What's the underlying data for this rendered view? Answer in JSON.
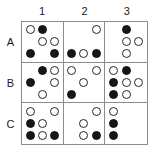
{
  "figure": {
    "title": "",
    "type": "dot-pattern-matrix",
    "rows": 3,
    "columns": 3,
    "colors": {
      "filled_dot": "#161616",
      "open_dot_outline": "#262626",
      "open_dot_fill": "#ffffff",
      "grid_line": "#8c8c8c",
      "background": "#ffffff",
      "label_text": "#1a1a1a"
    }
  },
  "column_headers": [
    {
      "label": "1"
    },
    {
      "label": "2"
    },
    {
      "label": "3"
    }
  ],
  "row_headers": [
    {
      "label": "A"
    },
    {
      "label": "B"
    },
    {
      "label": "C"
    }
  ],
  "cells": [
    {
      "id": "A1",
      "row": "A",
      "column": "1",
      "dots": [
        "white",
        "black",
        "empty",
        "empty",
        "white",
        "white",
        "black",
        "empty",
        "black"
      ]
    },
    {
      "id": "A2",
      "row": "A",
      "column": "2",
      "dots": [
        "empty",
        "empty",
        "white",
        "empty",
        "empty",
        "empty",
        "black",
        "white",
        "black"
      ]
    },
    {
      "id": "A3",
      "row": "A",
      "column": "3",
      "dots": [
        "empty",
        "black",
        "empty",
        "empty",
        "white",
        "white",
        "empty",
        "white",
        "empty"
      ]
    },
    {
      "id": "B1",
      "row": "B",
      "column": "1",
      "dots": [
        "empty",
        "black",
        "white",
        "black",
        "empty",
        "white",
        "empty",
        "white",
        "empty"
      ]
    },
    {
      "id": "B2",
      "row": "B",
      "column": "2",
      "dots": [
        "white",
        "empty",
        "white",
        "empty",
        "white",
        "empty",
        "black",
        "empty",
        "empty"
      ]
    },
    {
      "id": "B3",
      "row": "B",
      "column": "3",
      "dots": [
        "white",
        "black",
        "empty",
        "black",
        "white",
        "white",
        "black",
        "white",
        "empty"
      ]
    },
    {
      "id": "C1",
      "row": "C",
      "column": "1",
      "dots": [
        "white",
        "empty",
        "white",
        "black",
        "white",
        "empty",
        "black",
        "white",
        "black"
      ]
    },
    {
      "id": "C2",
      "row": "C",
      "column": "2",
      "dots": [
        "empty",
        "empty",
        "white",
        "empty",
        "white",
        "empty",
        "empty",
        "white",
        "black"
      ]
    },
    {
      "id": "C3",
      "row": "C",
      "column": "3",
      "dots": [
        "white",
        "empty",
        "empty",
        "black",
        "empty",
        "empty",
        "black",
        "empty",
        "empty"
      ]
    }
  ]
}
